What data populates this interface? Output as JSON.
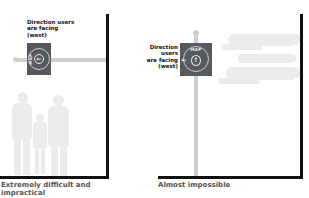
{
  "panels": [
    {
      "id": "left",
      "label": "Direction users are facing (west)",
      "label_lines": [
        "Direction users",
        "are facing",
        "(west)"
      ],
      "sign": {
        "text": "MAP",
        "orientation": "rotated",
        "arrow": "left"
      },
      "caption": "Extremely difficult and impractical",
      "caption_lines": [
        "Extremely difficult and",
        "impractical"
      ]
    },
    {
      "id": "right",
      "label": "Direction users are facing (west)",
      "label_lines": [
        "Direction",
        "users",
        "are facing",
        "(west)"
      ],
      "sign": {
        "text": "MAP",
        "orientation": "upright",
        "arrow": "left"
      },
      "caption": "Almost impossible"
    }
  ],
  "icons": {
    "arrow_left": "⟵",
    "arrow_up": "↑",
    "arrow_left_simple": "←"
  },
  "colors": {
    "wall": "#111111",
    "pole": "#cfcfcf",
    "sign": "#555a5f",
    "ghost_people": "#ebebeb",
    "caption": "#555555"
  }
}
